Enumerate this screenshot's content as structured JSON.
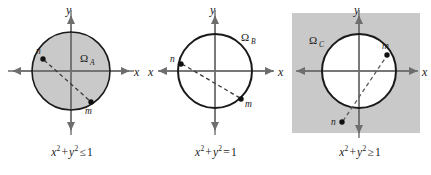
{
  "figure": {
    "background_color": "#ffffff",
    "shade_color": "#c9c9c9",
    "stroke_color": "#1a1a1a",
    "axis_color": "#7a7a7a"
  },
  "panels": [
    {
      "id": "panel-a",
      "region_label": "Ω",
      "region_subscript": "A",
      "caption": {
        "lhs_x": "x",
        "lhs_exp1": "2",
        "plus": "+",
        "lhs_y": "y",
        "lhs_exp2": "2",
        "relation": "≤",
        "rhs": "1"
      },
      "caption_text": "x2 + y2 ≤ 1",
      "fill": "inside",
      "axis_x_label": "x",
      "axis_y_label": "y",
      "points": [
        {
          "name": "n",
          "label": "n",
          "cx": 43,
          "cy": 59,
          "label_dx": -7,
          "label_dy": -5
        },
        {
          "name": "m",
          "label": "m",
          "cx": 91,
          "cy": 102,
          "label_dx": -2,
          "label_dy": 12
        }
      ],
      "connector": "dashed"
    },
    {
      "id": "panel-b",
      "region_label": "Ω",
      "region_subscript": "B",
      "caption": {
        "lhs_x": "x",
        "lhs_exp1": "2",
        "plus": "+",
        "lhs_y": "y",
        "lhs_exp2": "2",
        "relation": "=",
        "rhs": "1"
      },
      "caption_text": "x2 + y2 = 1",
      "fill": "boundary",
      "axis_x_label": "x",
      "axis_y_label": "y",
      "points": [
        {
          "name": "n",
          "label": "n",
          "cx": 37,
          "cy": 64,
          "label_dx": -9,
          "label_dy": -2
        },
        {
          "name": "m",
          "label": "m",
          "cx": 97,
          "cy": 99,
          "label_dx": 4,
          "label_dy": 8
        }
      ],
      "connector": "dashed"
    },
    {
      "id": "panel-c",
      "region_label": "Ω",
      "region_subscript": "C",
      "caption": {
        "lhs_x": "x",
        "lhs_exp1": "2",
        "plus": "+",
        "lhs_y": "y",
        "lhs_exp2": "2",
        "relation": "≥",
        "rhs": "1"
      },
      "caption_text": "x2 + y2 ≥ 1",
      "fill": "outside",
      "axis_x_label": "x",
      "axis_y_label": "y",
      "points": [
        {
          "name": "m",
          "label": "m",
          "cx": 99,
          "cy": 55,
          "label_dx": -2,
          "label_dy": -7
        },
        {
          "name": "n",
          "label": "n",
          "cx": 54,
          "cy": 122,
          "label_dx": -10,
          "label_dy": 3
        }
      ],
      "connector": "dashed"
    }
  ]
}
